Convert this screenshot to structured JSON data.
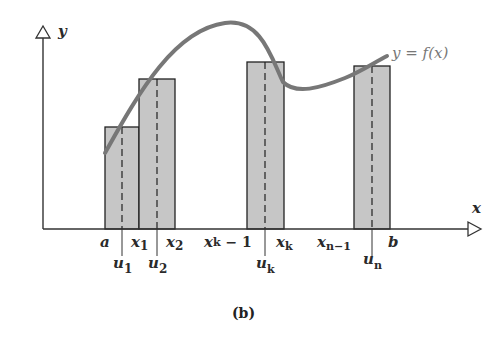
{
  "figure": {
    "caption": "(b)",
    "curve_label": "y = f(x)",
    "axis_labels": {
      "x": "x",
      "y": "y"
    },
    "ticks_top": [
      {
        "text": "a"
      },
      {
        "text": "x",
        "sub": "1"
      },
      {
        "text": "x",
        "sub": "2"
      },
      {
        "text": "x",
        "sub": "k",
        "suffix": " − 1"
      },
      {
        "text": "x",
        "sub": "k"
      },
      {
        "text": "x",
        "sub": "n−1"
      },
      {
        "text": "b"
      }
    ],
    "ticks_bottom": [
      {
        "text": "u",
        "sub": "1"
      },
      {
        "text": "u",
        "sub": "2"
      },
      {
        "text": "u",
        "sub": "k"
      },
      {
        "text": "u",
        "sub": "n"
      }
    ],
    "rectangles": [
      {
        "name": "rect-1",
        "x_left": "a",
        "x_right": "x1",
        "sample": "u1"
      },
      {
        "name": "rect-2",
        "x_left": "x1",
        "x_right": "x2",
        "sample": "u2"
      },
      {
        "name": "rect-k",
        "x_left": "xk-1",
        "x_right": "xk",
        "sample": "uk"
      },
      {
        "name": "rect-n",
        "x_left": "xn-1",
        "x_right": "b",
        "sample": "un"
      }
    ],
    "colors": {
      "curve": "#777777",
      "rect_fill": "#c8c8c8",
      "axis": "#333333"
    }
  }
}
